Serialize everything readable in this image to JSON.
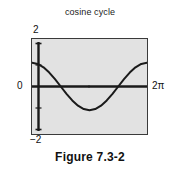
{
  "figure": {
    "caption": "Figure 7.3-2"
  },
  "chart_data": {
    "type": "line",
    "title": "cosine cycle",
    "xlabel": "",
    "ylabel": "",
    "xlim": [
      0,
      6.283185307
    ],
    "ylim": [
      -2,
      2
    ],
    "grid": false,
    "legend": false,
    "axis_tick_labels": {
      "y_max": "2",
      "y_zero": "0",
      "y_min": "−2",
      "x_max": "2π"
    },
    "series": [
      {
        "name": "cosine",
        "x": [
          0.0,
          0.3141592654,
          0.6283185307,
          0.9424777961,
          1.2566370614,
          1.5707963268,
          1.8849555922,
          2.1991148575,
          2.5132741229,
          2.8274333882,
          3.1415926536,
          3.455751919,
          3.7699111843,
          4.0840704497,
          4.398229715,
          4.7123889804,
          5.0265482457,
          5.3407075111,
          5.6548667765,
          5.9690260418,
          6.2831853072
        ],
        "y": [
          1.0,
          0.9510565163,
          0.8090169944,
          0.5877852523,
          0.3090169944,
          0.0,
          -0.3090169944,
          -0.5877852523,
          -0.8090169944,
          -0.9510565163,
          -1.0,
          -0.9510565163,
          -0.8090169944,
          -0.5877852523,
          -0.3090169944,
          0.0,
          0.3090169944,
          0.5877852523,
          0.8090169944,
          0.9510565163,
          1.0
        ]
      }
    ],
    "annotations": {
      "zero_line": true,
      "y_axis_line": true,
      "center_marker": true
    },
    "colors": {
      "plot_background": "#e2e2e2",
      "frame_border": "#3a3a3a",
      "curve": "#1a1a1a",
      "axis": "#111111",
      "page_background": "#ffffff"
    }
  }
}
